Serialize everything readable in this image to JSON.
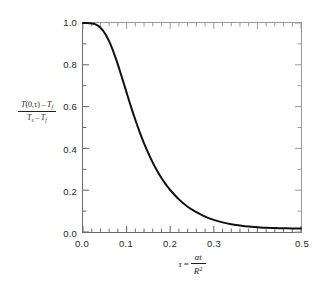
{
  "chart_data": {
    "type": "line",
    "title": "",
    "subtitle": "",
    "xlabel_parts": {
      "symbol": "τ",
      "equals": "=",
      "numerator_alpha": "α",
      "numerator_t": "t",
      "denominator_R": "R",
      "denominator_exp": "2"
    },
    "ylabel_parts": {
      "num_T": "T",
      "num_args": "(0,τ)",
      "num_minus": "–",
      "num_Tf_T": "T",
      "num_Tf_sub": "f",
      "den_Ts_T": "T",
      "den_Ts_sub": "s",
      "den_minus": "–",
      "den_Tf_T": "T",
      "den_Tf_sub": "f"
    },
    "xlim": [
      0.0,
      0.5
    ],
    "ylim": [
      0.0,
      1.0
    ],
    "x_major_ticks": [
      0.0,
      0.1,
      0.2,
      0.3,
      0.4,
      0.5
    ],
    "x_tick_labels": [
      "0.0",
      "0.1",
      "0.2",
      "0.3",
      "",
      "0.5"
    ],
    "y_major_ticks": [
      0.0,
      0.2,
      0.4,
      0.6,
      0.8,
      1.0
    ],
    "y_tick_labels": [
      "0.0",
      "0.2",
      "0.4",
      "0.6",
      "0.8",
      "1.0"
    ],
    "x_minor_per_major": 5,
    "y_minor_per_major": 2,
    "grid": false,
    "legend": null,
    "ticks_direction": "in",
    "axes_all_sides": true,
    "line_color": "#111111",
    "line_width": 2.0,
    "axis_color": "#6b6b6b",
    "background_color": "#ffffff",
    "x": [
      0.0,
      0.005,
      0.01,
      0.015,
      0.02,
      0.025,
      0.03,
      0.035,
      0.04,
      0.045,
      0.05,
      0.055,
      0.06,
      0.065,
      0.07,
      0.075,
      0.08,
      0.085,
      0.09,
      0.095,
      0.1,
      0.11,
      0.12,
      0.13,
      0.14,
      0.15,
      0.16,
      0.17,
      0.18,
      0.19,
      0.2,
      0.22,
      0.24,
      0.26,
      0.28,
      0.3,
      0.32,
      0.34,
      0.36,
      0.38,
      0.4,
      0.42,
      0.44,
      0.46,
      0.48,
      0.5
    ],
    "values": [
      1.0,
      1.0,
      1.0,
      0.999,
      0.998,
      0.996,
      0.992,
      0.986,
      0.977,
      0.966,
      0.951,
      0.933,
      0.912,
      0.888,
      0.861,
      0.832,
      0.801,
      0.768,
      0.735,
      0.701,
      0.667,
      0.6,
      0.537,
      0.478,
      0.424,
      0.376,
      0.332,
      0.293,
      0.258,
      0.228,
      0.201,
      0.156,
      0.121,
      0.095,
      0.074,
      0.058,
      0.046,
      0.037,
      0.031,
      0.026,
      0.023,
      0.02,
      0.019,
      0.018,
      0.017,
      0.017
    ]
  }
}
